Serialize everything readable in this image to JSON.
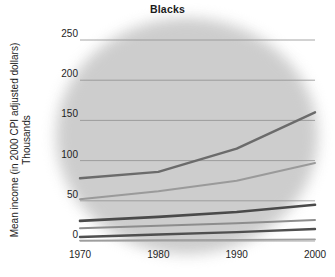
{
  "chart_data": {
    "type": "line",
    "title": "Blacks",
    "xlabel": "",
    "ylabel": "Mean income (in 2000 CPI adjusted dollars)",
    "ylabel_sub": "Thousands",
    "x": [
      1970,
      1980,
      1990,
      2000
    ],
    "xtick_labels": [
      "1970",
      "1980",
      "1990",
      "2000"
    ],
    "ytick_labels": [
      "250",
      "200",
      "150",
      "100",
      "50",
      "0"
    ],
    "yticks": [
      250,
      200,
      150,
      100,
      50,
      0
    ],
    "xlim": [
      1970,
      2000
    ],
    "ylim": [
      0,
      250
    ],
    "grid": true,
    "legend": "none",
    "series": [
      {
        "name": "top-quintile",
        "values": [
          78,
          86,
          115,
          160
        ],
        "color": "#6b6b6b",
        "width": 2.4
      },
      {
        "name": "fourth-quintile",
        "values": [
          52,
          62,
          75,
          97
        ],
        "color": "#9a9a9a",
        "width": 2.0
      },
      {
        "name": "third-quintile",
        "values": [
          25,
          30,
          36,
          45
        ],
        "color": "#4a4a4a",
        "width": 2.6
      },
      {
        "name": "second-quintile",
        "values": [
          16,
          19,
          22,
          26
        ],
        "color": "#8d8d8d",
        "width": 2.0
      },
      {
        "name": "first-quintile",
        "values": [
          5,
          8,
          11,
          15
        ],
        "color": "#4f4f4f",
        "width": 2.4
      },
      {
        "name": "lowest-quintile",
        "values": [
          0.5,
          1,
          1.5,
          2
        ],
        "color": "#9e9e9e",
        "width": 1.8
      }
    ]
  }
}
